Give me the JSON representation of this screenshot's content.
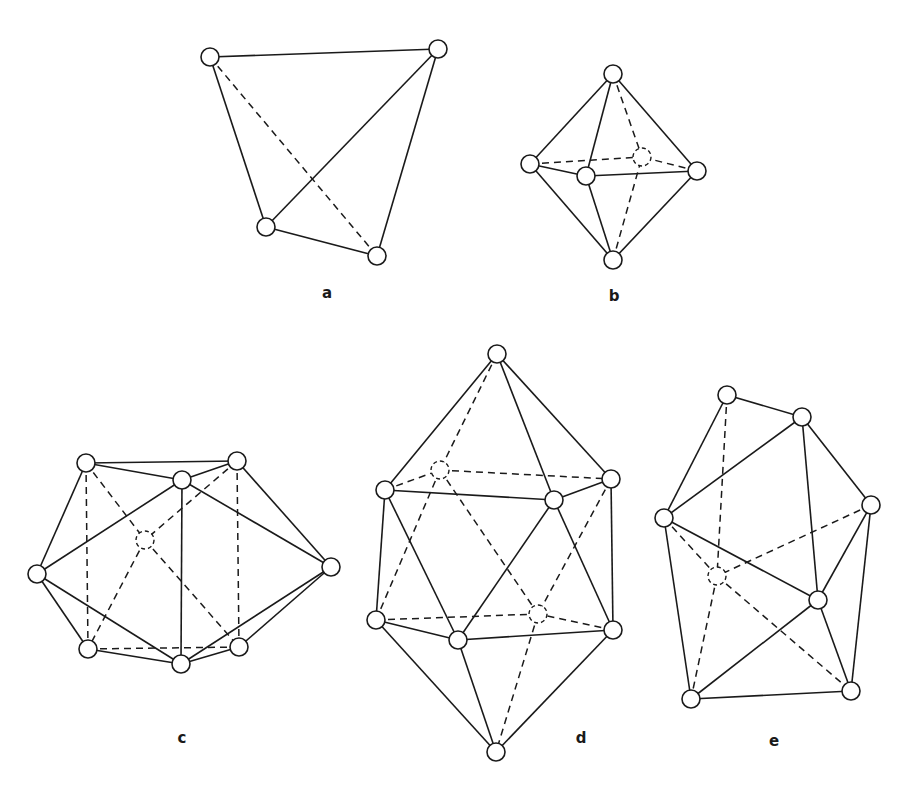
{
  "figure": {
    "vertex_radius": 9,
    "panels": [
      {
        "id": "a",
        "label": "a",
        "label_pos": [
          327,
          298
        ],
        "shape": "tetrahedron",
        "vertices": [
          [
            210,
            57
          ],
          [
            438,
            49
          ],
          [
            266,
            227
          ],
          [
            377,
            256
          ]
        ],
        "hidden_vertices": [],
        "solid_edges": [
          [
            0,
            1
          ],
          [
            0,
            2
          ],
          [
            1,
            2
          ],
          [
            1,
            3
          ],
          [
            2,
            3
          ]
        ],
        "dashed_edges": [
          [
            0,
            3
          ]
        ]
      },
      {
        "id": "b",
        "label": "b",
        "label_pos": [
          614,
          301
        ],
        "shape": "octahedron",
        "vertices": [
          [
            613,
            74
          ],
          [
            530,
            164
          ],
          [
            586,
            176
          ],
          [
            697,
            171
          ],
          [
            613,
            260
          ],
          [
            642,
            157
          ]
        ],
        "hidden_vertices": [
          5
        ],
        "solid_edges": [
          [
            0,
            1
          ],
          [
            0,
            2
          ],
          [
            0,
            3
          ],
          [
            1,
            2
          ],
          [
            2,
            3
          ],
          [
            1,
            4
          ],
          [
            2,
            4
          ],
          [
            3,
            4
          ]
        ],
        "dashed_edges": [
          [
            0,
            5
          ],
          [
            1,
            5
          ],
          [
            3,
            5
          ],
          [
            4,
            5
          ]
        ]
      },
      {
        "id": "c",
        "label": "c",
        "label_pos": [
          182,
          743
        ],
        "shape": "capped-prism",
        "vertices": [
          [
            86,
            463
          ],
          [
            237,
            461
          ],
          [
            182,
            480
          ],
          [
            37,
            574
          ],
          [
            331,
            567
          ],
          [
            88,
            649
          ],
          [
            239,
            647
          ],
          [
            181,
            664
          ],
          [
            145,
            540
          ]
        ],
        "hidden_vertices": [
          8
        ],
        "solid_edges": [
          [
            0,
            1
          ],
          [
            0,
            2
          ],
          [
            1,
            2
          ],
          [
            0,
            3
          ],
          [
            3,
            2
          ],
          [
            3,
            5
          ],
          [
            3,
            7
          ],
          [
            1,
            4
          ],
          [
            2,
            4
          ],
          [
            2,
            7
          ],
          [
            4,
            6
          ],
          [
            4,
            7
          ],
          [
            5,
            7
          ],
          [
            6,
            7
          ]
        ],
        "dashed_edges": [
          [
            0,
            5
          ],
          [
            1,
            6
          ],
          [
            5,
            6
          ],
          [
            0,
            8
          ],
          [
            1,
            8
          ],
          [
            8,
            5
          ],
          [
            8,
            6
          ]
        ]
      },
      {
        "id": "d",
        "label": "d",
        "label_pos": [
          581,
          743
        ],
        "shape": "icosahedron",
        "vertices": [
          [
            497,
            354
          ],
          [
            385,
            490
          ],
          [
            554,
            500
          ],
          [
            611,
            479
          ],
          [
            376,
            620
          ],
          [
            458,
            640
          ],
          [
            613,
            630
          ],
          [
            496,
            752
          ],
          [
            440,
            470
          ],
          [
            538,
            614
          ]
        ],
        "hidden_vertices": [
          8,
          9
        ],
        "solid_edges": [
          [
            0,
            1
          ],
          [
            0,
            2
          ],
          [
            0,
            3
          ],
          [
            1,
            2
          ],
          [
            2,
            3
          ],
          [
            1,
            4
          ],
          [
            1,
            5
          ],
          [
            3,
            6
          ],
          [
            2,
            5
          ],
          [
            2,
            6
          ],
          [
            4,
            5
          ],
          [
            5,
            6
          ],
          [
            4,
            7
          ],
          [
            5,
            7
          ],
          [
            6,
            7
          ]
        ],
        "dashed_edges": [
          [
            0,
            8
          ],
          [
            1,
            8
          ],
          [
            8,
            3
          ],
          [
            8,
            4
          ],
          [
            8,
            9
          ],
          [
            3,
            9
          ],
          [
            4,
            9
          ],
          [
            6,
            9
          ],
          [
            9,
            7
          ]
        ]
      },
      {
        "id": "e",
        "label": "e",
        "label_pos": [
          774,
          746
        ],
        "shape": "irregular-polyhedron",
        "vertices": [
          [
            727,
            395
          ],
          [
            802,
            417
          ],
          [
            664,
            518
          ],
          [
            871,
            505
          ],
          [
            818,
            600
          ],
          [
            691,
            699
          ],
          [
            851,
            691
          ],
          [
            717,
            576
          ]
        ],
        "hidden_vertices": [
          7
        ],
        "solid_edges": [
          [
            0,
            1
          ],
          [
            0,
            2
          ],
          [
            1,
            2
          ],
          [
            1,
            3
          ],
          [
            1,
            4
          ],
          [
            2,
            4
          ],
          [
            2,
            5
          ],
          [
            3,
            4
          ],
          [
            3,
            6
          ],
          [
            4,
            5
          ],
          [
            4,
            6
          ],
          [
            5,
            6
          ]
        ],
        "dashed_edges": [
          [
            0,
            7
          ],
          [
            2,
            7
          ],
          [
            3,
            7
          ],
          [
            7,
            5
          ],
          [
            7,
            6
          ]
        ]
      }
    ]
  }
}
